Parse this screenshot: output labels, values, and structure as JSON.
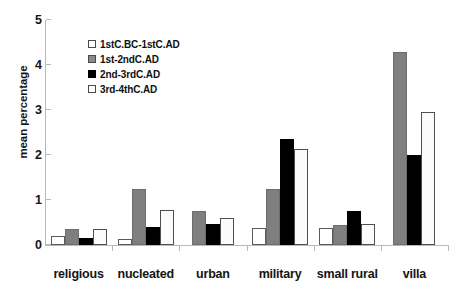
{
  "chart_data": {
    "type": "bar",
    "title": "",
    "xlabel": "",
    "ylabel": "mean percentage",
    "ylim": [
      0,
      5
    ],
    "yticks": [
      "0",
      "1",
      "2",
      "3",
      "4",
      "5"
    ],
    "grid": false,
    "legend_position": "upper-left-inside",
    "categories": [
      "religious",
      "nucleated",
      "urban",
      "military",
      "small rural",
      "villa"
    ],
    "series": [
      {
        "name": "1stC.BC-1stC.AD",
        "color": "#ffffff",
        "values": [
          0.19,
          0.13,
          null,
          0.37,
          0.37,
          null
        ]
      },
      {
        "name": "1st-2ndC.AD",
        "color": "#7f7f7f",
        "values": [
          0.35,
          1.25,
          0.75,
          1.25,
          0.45,
          4.29
        ]
      },
      {
        "name": "2nd-3rdC.AD",
        "color": "#000000",
        "values": [
          0.16,
          0.39,
          0.46,
          2.36,
          0.76,
          2.01
        ]
      },
      {
        "name": "3rd-4thC.AD",
        "color": "#fbfbfb",
        "values": [
          0.35,
          0.77,
          0.59,
          2.14,
          0.47,
          2.96
        ]
      }
    ]
  },
  "legend": {
    "items": [
      {
        "label": "1stC.BC-1stC.AD"
      },
      {
        "label": "1st-2ndC.AD"
      },
      {
        "label": "2nd-3rdC.AD"
      },
      {
        "label": "3rd-4thC.AD"
      }
    ]
  },
  "axes": {
    "y_title": "mean percentage"
  }
}
